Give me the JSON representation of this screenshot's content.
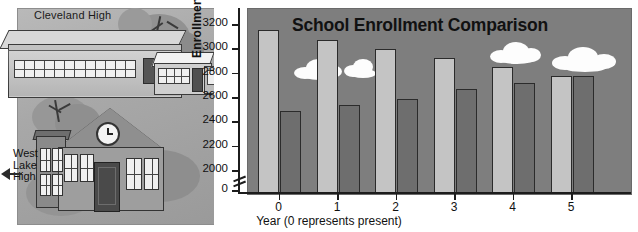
{
  "chart_data": {
    "type": "bar",
    "title": "School Enrollment Comparison",
    "xlabel": "Year (0 represents present)",
    "ylabel": "Enrollment",
    "categories": [
      "0",
      "1",
      "2",
      "3",
      "4",
      "5"
    ],
    "series": [
      {
        "name": "Cleveland High",
        "color": "#c4c4c4",
        "values": [
          3160,
          3080,
          3005,
          2930,
          2855,
          2780
        ]
      },
      {
        "name": "West Lake High",
        "color": "#6e6e6e",
        "values": [
          2490,
          2545,
          2595,
          2670,
          2725,
          2780
        ]
      }
    ],
    "yticks": [
      "3200",
      "3000",
      "2800",
      "2600",
      "2400",
      "2200",
      "2000",
      "0"
    ],
    "ylim": [
      1900,
      3280
    ],
    "y_axis_break": true,
    "grid": false,
    "legend": "illustration"
  },
  "illustration": {
    "cleveland_label": "Cleveland High",
    "westlake_label_lines": [
      "West",
      "Lake",
      "High"
    ],
    "clock_icon": "clock-icon"
  },
  "icons": {
    "cloud": "cloud-icon",
    "arrow_left": "arrow-left-icon",
    "tree": "tree-icon"
  },
  "colors": {
    "plot_background": "#7e7e7e",
    "bar_light": "#c4c4c4",
    "bar_dark": "#6e6e6e",
    "axis": "#1c1c1c",
    "cloud": "#fdfdfd",
    "panel_background": "#b0b0b0"
  }
}
